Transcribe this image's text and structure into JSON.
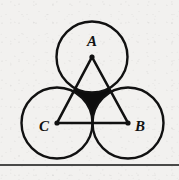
{
  "figure": {
    "background_color": "#f2f1ef",
    "stroke_color": "#111111",
    "shade_color": "#0d0d0d",
    "labels": {
      "apex": "A",
      "right": "B",
      "left": "C"
    },
    "label_positions": {
      "apex": {
        "x": 92,
        "y": 46
      },
      "right": {
        "x": 140,
        "y": 131
      },
      "left": {
        "x": 44,
        "y": 131
      }
    },
    "triangle": {
      "name": "equilateral-triangle-ABC",
      "vertices": [
        {
          "name": "A",
          "x": 92,
          "y": 57
        },
        {
          "name": "B",
          "x": 128,
          "y": 123
        },
        {
          "name": "C",
          "x": 57,
          "y": 123
        }
      ],
      "side_length": 71,
      "stroke_width": 2.6
    },
    "circles": [
      {
        "name": "circle-A",
        "cx": 92,
        "cy": 57,
        "r": 35.5
      },
      {
        "name": "circle-B",
        "cx": 128,
        "cy": 123,
        "r": 35.5
      },
      {
        "name": "circle-C",
        "cx": 57,
        "cy": 123,
        "r": 35.5
      }
    ],
    "circle_radius": 35.5,
    "circle_stroke_width": 2.4,
    "vertex_dot_radius": 2.6,
    "shaded_region": {
      "name": "curvilinear-triangle-shaded",
      "description": "concave curvilinear triangle bounded by the three circular arcs between the tangency points",
      "tangency_points": [
        {
          "x": 74.5,
          "y": 90
        },
        {
          "x": 110,
          "y": 90
        },
        {
          "x": 92.5,
          "y": 123
        }
      ]
    },
    "baseline_rule": {
      "name": "bottom-horizontal-rule",
      "y": 165,
      "x1": 0,
      "x2": 179,
      "stroke_width": 1.6
    }
  }
}
